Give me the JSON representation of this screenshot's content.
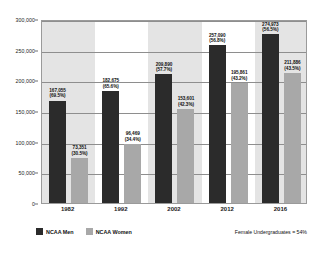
{
  "chart_data": {
    "type": "bar",
    "title": "",
    "xlabel": "",
    "ylabel": "",
    "ylim": [
      0,
      300000
    ],
    "ytick_step": 50000,
    "grid": true,
    "legend_position": "bottom-left",
    "categories": [
      "1982",
      "1992",
      "2002",
      "2012",
      "2016"
    ],
    "ytick_labels": [
      "0",
      "50,000",
      "100,000",
      "150,000",
      "200,000",
      "250,000",
      "300,000"
    ],
    "ytick_values": [
      0,
      50000,
      100000,
      150000,
      200000,
      250000,
      300000
    ],
    "series": [
      {
        "name": "NCAA Men",
        "color": "#2b2b2b",
        "values": [
          167055,
          182675,
          209890,
          257090,
          274973
        ],
        "value_labels": [
          "167,055",
          "182,675",
          "209,890",
          "257,090",
          "274,973"
        ],
        "percent_labels": [
          "(69.5%)",
          "(65.6%)",
          "(57.7%)",
          "(56.8%)",
          "(56.5%)"
        ]
      },
      {
        "name": "NCAA Women",
        "color": "#a8a8a8",
        "values": [
          73351,
          96469,
          153601,
          195861,
          211886
        ],
        "value_labels": [
          "73,351",
          "96,469",
          "153,601",
          "195,861",
          "211,886"
        ],
        "percent_labels": [
          "(30.5%)",
          "(34.4%)",
          "(42.3%)",
          "(43.2%)",
          "(43.5%)"
        ]
      }
    ],
    "annotations": [
      {
        "name": "female-undergraduates-note",
        "text": "Female Undergraduates = 54%"
      }
    ],
    "band_shading": [
      "gray",
      "white",
      "gray",
      "white",
      "gray"
    ]
  }
}
